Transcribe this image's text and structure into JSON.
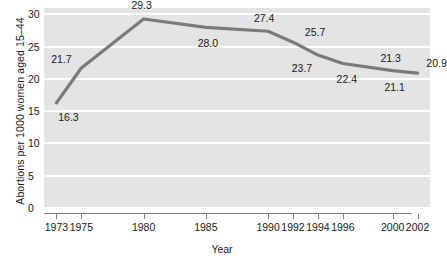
{
  "chart_data": {
    "type": "line",
    "title": "",
    "xlabel": "Year",
    "ylabel": "Abortions per 1000 women aged 15–44",
    "xlim": [
      1972,
      2003
    ],
    "ylim": [
      0,
      31
    ],
    "xticks": [
      1973,
      1975,
      1980,
      1985,
      1990,
      1992,
      1994,
      1996,
      2000,
      2002
    ],
    "xtick_labels": [
      "1973",
      "1975",
      "1980",
      "1985",
      "1990",
      "1992",
      "1994",
      "1996",
      "2000",
      "2002"
    ],
    "yticks": [
      0,
      5,
      10,
      15,
      20,
      25,
      30
    ],
    "ytick_labels": [
      "0",
      "5",
      "10",
      "15",
      "20",
      "25",
      "30"
    ],
    "grid": "horizontal-white-on-gray",
    "legend": "none",
    "line_color": "#7a7a7a",
    "plot_bg": "#e4e4e4",
    "gridline_color": "#ffffff",
    "axis_color": "#7d7d7d",
    "text_color": "#1a1a1a",
    "x": [
      1973,
      1975,
      1980,
      1985,
      1990,
      1992,
      1994,
      1996,
      2000,
      2002
    ],
    "values": [
      16.3,
      21.7,
      29.3,
      28.0,
      27.4,
      25.7,
      23.7,
      22.4,
      21.3,
      20.9
    ],
    "point_labels": [
      {
        "x": 1973,
        "y": 16.3,
        "text": "16.3",
        "pos": "below-right"
      },
      {
        "x": 1975,
        "y": 21.7,
        "text": "21.7",
        "pos": "above-left"
      },
      {
        "x": 1980,
        "y": 29.3,
        "text": "29.3",
        "pos": "above"
      },
      {
        "x": 1985,
        "y": 28.0,
        "text": "28.0",
        "pos": "below"
      },
      {
        "x": 1990,
        "y": 27.4,
        "text": "27.4",
        "pos": "above"
      },
      {
        "x": 1992,
        "y": 25.7,
        "text": "25.7",
        "pos": "above-right"
      },
      {
        "x": 1994,
        "y": 23.7,
        "text": "23.7",
        "pos": "below-left"
      },
      {
        "x": 1996,
        "y": 22.4,
        "text": "22.4",
        "pos": "below"
      },
      {
        "x": 2000,
        "y": 21.3,
        "text": "21.3",
        "pos": "above"
      },
      {
        "x": 2002,
        "y": 20.9,
        "text": "20.9",
        "pos": "above-right"
      }
    ],
    "extra_labels": [
      {
        "text": "21.1",
        "anchor_x": 2000,
        "anchor_y": 21.3,
        "note": "label below line near 2000–2002"
      }
    ]
  }
}
